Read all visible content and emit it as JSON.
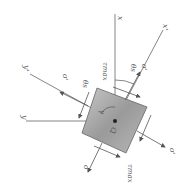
{
  "diagram": {
    "type": "stress-element-rotated",
    "labels": {
      "x_axis": "x",
      "y_axis": "y",
      "x_prime_axis": "x'",
      "y_prime_axis": "y'",
      "origin": "Q",
      "theta_s_top": "θs",
      "theta_s_left": "θs",
      "sigma_prime_top": "σ'",
      "sigma_prime_left": "σ'",
      "sigma_prime_right": "σ'",
      "sigma_prime_bottom": "σ'",
      "tau_max_top": "τmax",
      "tau_max_bottom": "τmax",
      "gamma": "γ"
    },
    "colors": {
      "line": "#555555",
      "element_fill": "#a8a8a8",
      "element_edge": "#666666"
    }
  }
}
